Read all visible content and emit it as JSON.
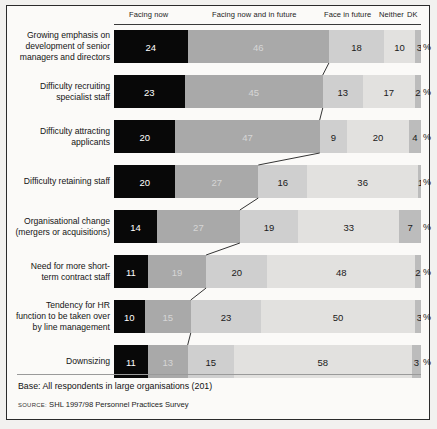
{
  "chart_data": {
    "type": "bar",
    "subtype": "100% stacked horizontal bar",
    "title": "",
    "xlabel": "",
    "ylabel": "",
    "xlim": [
      0,
      101
    ],
    "grid": false,
    "legend_position": "top",
    "unit": "%",
    "categories": [
      "Growing emphasis on development of senior managers and directors",
      "Difficulty recruiting specialist staff",
      "Difficulty attracting applicants",
      "Difficulty retaining staff",
      "Organisational change (mergers or acquisitions)",
      "Need for more short-term contract staff",
      "Tendency for HR function to be taken over by line management",
      "Downsizing"
    ],
    "series": [
      {
        "name": "Facing now",
        "values": [
          24,
          23,
          20,
          20,
          14,
          11,
          10,
          11
        ]
      },
      {
        "name": "Facing now and in future",
        "values": [
          46,
          45,
          47,
          27,
          27,
          19,
          15,
          13
        ]
      },
      {
        "name": "Face in future",
        "values": [
          18,
          13,
          9,
          16,
          19,
          20,
          23,
          15
        ]
      },
      {
        "name": "Neither",
        "values": [
          10,
          17,
          20,
          36,
          33,
          48,
          50,
          58
        ]
      },
      {
        "name": "DK",
        "values": [
          3,
          2,
          4,
          1,
          7,
          2,
          3,
          3
        ]
      }
    ],
    "annotations": [
      "Base: All respondents in large organisations (201)",
      "SOURCE: SHL 1997/98 Personnel Practices Survey"
    ]
  },
  "header": {
    "columns": [
      {
        "label": "Facing now"
      },
      {
        "label": "Facing now and in future"
      },
      {
        "label": "Face in future"
      },
      {
        "label": "Neither"
      },
      {
        "label": "DK"
      }
    ]
  },
  "rows": [
    {
      "label_lines": [
        "Growing emphasis on",
        "development of senior",
        "managers and directors"
      ],
      "values": [
        24,
        46,
        18,
        10,
        3
      ],
      "percent_sign": "%"
    },
    {
      "label_lines": [
        "Difficulty recruiting",
        "specialist staff"
      ],
      "values": [
        23,
        45,
        13,
        17,
        2
      ],
      "percent_sign": "%"
    },
    {
      "label_lines": [
        "Difficulty attracting",
        "applicants"
      ],
      "values": [
        20,
        47,
        9,
        20,
        4
      ],
      "percent_sign": "%"
    },
    {
      "label_lines": [
        "Difficulty retaining staff"
      ],
      "values": [
        20,
        27,
        16,
        36,
        1
      ],
      "percent_sign": "%"
    },
    {
      "label_lines": [
        "Organisational change",
        "(mergers or acquisitions)"
      ],
      "values": [
        14,
        27,
        19,
        33,
        7
      ],
      "percent_sign": "%"
    },
    {
      "label_lines": [
        "Need for more short-",
        "term contract staff"
      ],
      "values": [
        11,
        19,
        20,
        48,
        2
      ],
      "percent_sign": "%"
    },
    {
      "label_lines": [
        "Tendency for HR",
        "function to be taken over",
        "by line management"
      ],
      "values": [
        10,
        15,
        23,
        50,
        3
      ],
      "percent_sign": "%"
    },
    {
      "label_lines": [
        "Downsizing"
      ],
      "values": [
        11,
        13,
        15,
        58,
        3
      ],
      "percent_sign": "%"
    }
  ],
  "footer": {
    "base": "Base: All respondents in large organisations (201)",
    "source_keyword": "SOURCE:",
    "source_text": "SHL 1997/98 Personnel Practices Survey"
  },
  "colors": {
    "facing_now": "#080808",
    "facing_now_and_in_future": "#a9a9a9",
    "face_in_future": "#cfcfcf",
    "neither": "#e2e1df",
    "dk": "#bcbcbc",
    "page_background": "#f2f1ef",
    "panel_background": "#fbfaf8",
    "border": "#2b2b2b"
  }
}
